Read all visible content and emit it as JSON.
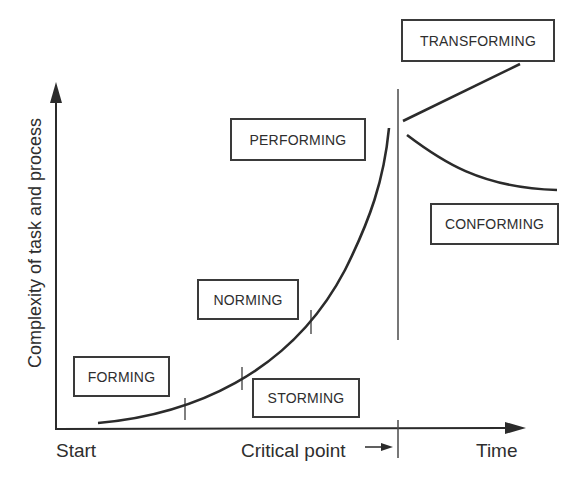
{
  "diagram": {
    "title": "",
    "y_axis_label": "Complexity of task and process",
    "x_axis_labels": {
      "start": "Start",
      "critical_point": "Critical point",
      "time": "Time"
    },
    "stages": [
      {
        "id": "forming",
        "label": "FORMING"
      },
      {
        "id": "storming",
        "label": "STORMING"
      },
      {
        "id": "norming",
        "label": "NORMING"
      },
      {
        "id": "performing",
        "label": "PERFORMING"
      },
      {
        "id": "transforming",
        "label": "TRANSFORMING"
      },
      {
        "id": "conforming",
        "label": "CONFORMING"
      }
    ],
    "colors": {
      "line": "#2b2b2b",
      "box_border": "#3a3a3a",
      "background": "#ffffff"
    }
  }
}
